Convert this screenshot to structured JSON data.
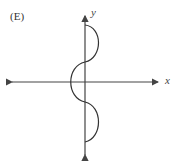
{
  "diagram": {
    "option_label": "(E)",
    "axes": {
      "x_label": "x",
      "y_label": "y"
    },
    "curve_description": "S-shaped curve along the y-axis: bulges right above the x-axis, bulges left across the x-axis, bulges right below the x-axis",
    "colors": {
      "axis": "#444444",
      "curve": "#333333",
      "background": "#ffffff"
    }
  }
}
